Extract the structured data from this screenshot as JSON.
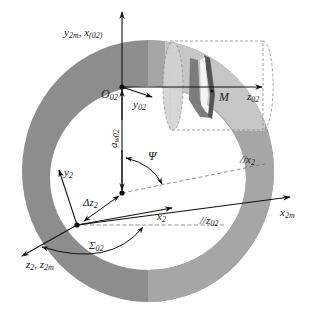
{
  "diagram": {
    "type": "gear-coordinate-system",
    "colors": {
      "ring_dark": "#8a8a8a",
      "ring_light": "#b4b4b4",
      "cylinder_fill": "#cfcfcf",
      "tooth_dark": "#5e5e5e",
      "tooth_mid": "#7a7a7a",
      "line": "#111111",
      "dashed": "#888888"
    },
    "labels": {
      "y2m_x02": {
        "main": "y",
        "sub": "2m",
        "sep": ", ",
        "main2": "x",
        "sub2": "(02)"
      },
      "O02": {
        "main": "O",
        "sub": "02"
      },
      "y02": {
        "main": "y",
        "sub": "02"
      },
      "z02": {
        "main": "z",
        "sub": "02"
      },
      "M": {
        "main": "M"
      },
      "aw02": {
        "main": "a",
        "sub": "w02"
      },
      "psi": {
        "main": "Ψ"
      },
      "par_x2": {
        "main": "//x",
        "sub": "2"
      },
      "y2": {
        "main": "y",
        "sub": "2"
      },
      "dz2": {
        "main": "Δz",
        "sub": "2"
      },
      "x2": {
        "main": "x",
        "sub": "2"
      },
      "par_z02": {
        "main": "//z",
        "sub": "02"
      },
      "x2m": {
        "main": "x",
        "sub": "2m"
      },
      "sigma02": {
        "main": "Σ",
        "sub": "02"
      },
      "z2_z2m": {
        "main": "z",
        "sub": "2",
        "sep": ", ",
        "main2": "z",
        "sub2": "2m"
      }
    }
  }
}
